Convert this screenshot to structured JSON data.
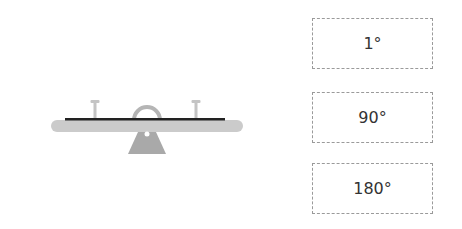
{
  "illustration": {
    "name": "seesaw",
    "colors": {
      "beam": "#c8c8c8",
      "seat_line": "#222222",
      "base": "#a9a9a9",
      "handle": "#c0c0c0"
    }
  },
  "options": [
    {
      "label": "1°"
    },
    {
      "label": "90°"
    },
    {
      "label": "180°"
    }
  ]
}
